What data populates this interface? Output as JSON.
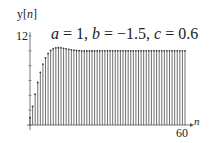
{
  "chart_data": {
    "type": "stem",
    "title": "a = 1, b = −1.5, c = 0.6",
    "title_parts": {
      "a": "1",
      "b": "−1.5",
      "c": "0.6"
    },
    "xlabel": "n",
    "ylabel": "y[n]",
    "xlim": [
      0,
      60
    ],
    "ylim": [
      0,
      12
    ],
    "x_tick_labels": [
      "60"
    ],
    "y_tick_labels": [
      "12"
    ],
    "y_minor_tick_step": 2,
    "grid": false,
    "legend": null,
    "x": [
      0,
      1,
      2,
      3,
      4,
      5,
      6,
      7,
      8,
      9,
      10,
      11,
      12,
      13,
      14,
      15,
      16,
      17,
      18,
      19,
      20,
      21,
      22,
      23,
      24,
      25,
      26,
      27,
      28,
      29,
      30,
      31,
      32,
      33,
      34,
      35,
      36,
      37,
      38,
      39,
      40,
      41,
      42,
      43,
      44,
      45,
      46,
      47,
      48,
      49,
      50,
      51,
      52,
      53,
      54,
      55,
      56,
      57,
      58,
      59,
      60
    ],
    "values": [
      1.0,
      2.5,
      4.15,
      5.73,
      7.1,
      8.21,
      9.06,
      9.66,
      10.06,
      10.29,
      10.4,
      10.42,
      10.4,
      10.34,
      10.27,
      10.21,
      10.14,
      10.09,
      10.05,
      10.02,
      10.0,
      9.99,
      9.99,
      9.99,
      9.99,
      9.99,
      10.0,
      10.0,
      10.0,
      10.0,
      10.0,
      10.0,
      10.0,
      10.0,
      10.0,
      10.0,
      10.0,
      10.0,
      10.0,
      10.0,
      10.0,
      10.0,
      10.0,
      10.0,
      10.0,
      10.0,
      10.0,
      10.0,
      10.0,
      10.0,
      10.0,
      10.0,
      10.0,
      10.0,
      10.0,
      10.0,
      10.0,
      10.0,
      10.0,
      10.0,
      10.0
    ]
  },
  "labels": {
    "ylabel_prefix": "y[",
    "ylabel_var": "n",
    "ylabel_suffix": "]",
    "ytick_top": "12",
    "xtick_end": "60",
    "xlabel": "n",
    "title_a_var": "a",
    "title_a_val": " = 1, ",
    "title_b_var": "b",
    "title_b_val": " = −1.5, ",
    "title_c_var": "c",
    "title_c_val": " = 0.6"
  },
  "colors": {
    "stem": "#333333",
    "axis": "#555555",
    "background": "#ffffff"
  }
}
